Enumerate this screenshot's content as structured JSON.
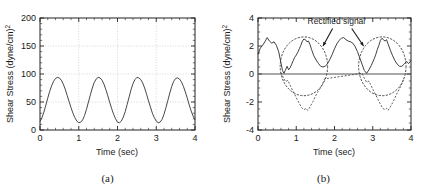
{
  "figure": {
    "panel_a_label": "(a)",
    "panel_b_label": "(b)"
  },
  "panel_a": {
    "xlabel": "Time (sec)",
    "ylabel": "Shear Stress (dyne/cm²)",
    "xticks": [
      "0",
      "1",
      "2",
      "3",
      "4"
    ],
    "yticks": [
      "0",
      "50",
      "100",
      "150",
      "200"
    ]
  },
  "panel_b": {
    "xlabel": "Time (sec)",
    "ylabel": "Shear Stress (dyne/cm²)",
    "xticks": [
      "0",
      "1",
      "2",
      "3",
      "4"
    ],
    "yticks": [
      "-4",
      "-2",
      "0",
      "2",
      "4"
    ],
    "annotation": "Rectified signal"
  },
  "colors": {
    "line": "#333333",
    "grid": "#bbbbbb",
    "axis": "#222222",
    "zero_line": "#555555",
    "dashed": "#444444"
  },
  "chart_data": [
    {
      "type": "line",
      "title": "(a)",
      "xlabel": "Time (sec)",
      "ylabel": "Shear Stress (dyne/cm²)",
      "xlim": [
        0,
        4
      ],
      "ylim": [
        0,
        200
      ],
      "xticks": [
        0,
        1,
        2,
        3,
        4
      ],
      "yticks": [
        0,
        50,
        100,
        150,
        200
      ],
      "grid": true,
      "legend": "none",
      "series": [
        {
          "name": "Pulsatile shear stress",
          "style": "solid",
          "period_sec": 1.0,
          "peak_value": 94,
          "trough_value": 13,
          "x": [
            0.0,
            0.05,
            0.1,
            0.15,
            0.2,
            0.25,
            0.3,
            0.35,
            0.4,
            0.45,
            0.5,
            0.55,
            0.6,
            0.65,
            0.7,
            0.75,
            0.8,
            0.85,
            0.9,
            0.95,
            1.0,
            1.05,
            1.1,
            1.15,
            1.2,
            1.25,
            1.3,
            1.35,
            1.4,
            1.45,
            1.5,
            1.55,
            1.6,
            1.65,
            1.7,
            1.75,
            1.8,
            1.85,
            1.9,
            1.95,
            2.0,
            2.05,
            2.1,
            2.15,
            2.2,
            2.25,
            2.3,
            2.35,
            2.4,
            2.45,
            2.5,
            2.55,
            2.6,
            2.65,
            2.7,
            2.75,
            2.8,
            2.85,
            2.9,
            2.95,
            3.0,
            3.05,
            3.1,
            3.15,
            3.2,
            3.25,
            3.3,
            3.35,
            3.4,
            3.45,
            3.5,
            3.55,
            3.6,
            3.65,
            3.7,
            3.75,
            3.8,
            3.85,
            3.9,
            3.95,
            4.0
          ],
          "y": [
            15,
            22,
            32,
            44,
            57,
            69,
            79,
            87,
            92,
            94,
            93,
            89,
            82,
            73,
            62,
            51,
            40,
            30,
            22,
            16,
            13,
            14,
            18,
            26,
            37,
            50,
            63,
            75,
            85,
            91,
            94,
            93,
            89,
            82,
            72,
            61,
            49,
            38,
            28,
            20,
            14,
            13,
            16,
            23,
            33,
            46,
            59,
            72,
            83,
            90,
            94,
            93,
            90,
            84,
            75,
            64,
            52,
            41,
            30,
            22,
            16,
            13,
            14,
            19,
            28,
            40,
            53,
            66,
            78,
            87,
            92,
            93,
            91,
            86,
            78,
            68,
            57,
            45,
            34,
            25,
            18
          ]
        }
      ]
    },
    {
      "type": "line",
      "title": "(b)",
      "xlabel": "Time (sec)",
      "ylabel": "Shear Stress (dyne/cm²)",
      "xlim": [
        0,
        4
      ],
      "ylim": [
        -4,
        4
      ],
      "xticks": [
        0,
        1,
        2,
        3,
        4
      ],
      "yticks": [
        -4,
        -2,
        0,
        2,
        4
      ],
      "grid": false,
      "zero_line": true,
      "annotations": [
        {
          "text": "Rectified signal",
          "x": 2.05,
          "y": 3.6
        },
        {
          "shape": "ellipse",
          "center_x": 1.2,
          "center_y": 0.55,
          "rx": 0.62,
          "ry": 2.1
        },
        {
          "shape": "ellipse",
          "center_x": 3.25,
          "center_y": 0.55,
          "rx": 0.62,
          "ry": 2.1
        },
        {
          "shape": "arrow",
          "from_x": 1.95,
          "from_y": 3.25,
          "to_x": 1.7,
          "to_y": 2.0
        },
        {
          "shape": "arrow",
          "from_x": 2.45,
          "from_y": 3.25,
          "to_x": 2.76,
          "to_y": 2.0
        }
      ],
      "series": [
        {
          "name": "Rectified signal",
          "style": "solid",
          "x": [
            0.0,
            0.06,
            0.12,
            0.18,
            0.24,
            0.3,
            0.36,
            0.42,
            0.48,
            0.54,
            0.6,
            0.64,
            0.68,
            0.72,
            0.76,
            0.8,
            0.84,
            0.88,
            0.92,
            0.96,
            1.0,
            1.04,
            1.08,
            1.12,
            1.16,
            1.2,
            1.24,
            1.28,
            1.32,
            1.36,
            1.4,
            1.46,
            1.52,
            1.58,
            1.64,
            1.7,
            1.76,
            1.82,
            1.88,
            1.94,
            2.0,
            2.06,
            2.12,
            2.18,
            2.24,
            2.3,
            2.36,
            2.42,
            2.48,
            2.54,
            2.6,
            2.66,
            2.72,
            2.78,
            2.84,
            2.9,
            2.96,
            3.0,
            3.04,
            3.08,
            3.12,
            3.16,
            3.2,
            3.24,
            3.28,
            3.32,
            3.36,
            3.4,
            3.46,
            3.52,
            3.58,
            3.64,
            3.7,
            3.76,
            3.82,
            3.88,
            3.94,
            4.0
          ],
          "y": [
            1.4,
            1.85,
            2.05,
            2.3,
            2.6,
            2.35,
            2.2,
            2.3,
            2.05,
            1.6,
            0.8,
            0.25,
            0.05,
            0.3,
            0.55,
            0.3,
            0.45,
            0.7,
            0.95,
            1.2,
            1.35,
            1.55,
            1.8,
            2.05,
            2.35,
            2.5,
            2.45,
            2.3,
            2.35,
            2.1,
            1.75,
            1.3,
            1.0,
            0.75,
            0.55,
            0.5,
            0.55,
            0.75,
            1.05,
            1.4,
            1.8,
            2.15,
            2.4,
            2.55,
            2.6,
            2.45,
            2.35,
            2.3,
            2.2,
            1.95,
            1.6,
            1.15,
            0.7,
            0.25,
            0.05,
            0.3,
            0.6,
            0.85,
            1.1,
            1.4,
            1.75,
            2.05,
            2.4,
            2.55,
            2.45,
            2.35,
            2.45,
            2.15,
            1.7,
            1.3,
            0.95,
            0.7,
            0.55,
            0.55,
            0.7,
            0.9,
            0.75,
            0.95
          ]
        },
        {
          "name": "Original signal (negative half)",
          "style": "dashed",
          "x": [
            0.6,
            0.66,
            0.72,
            0.78,
            0.84,
            0.9,
            0.96,
            1.02,
            1.08,
            1.14,
            1.2,
            1.26,
            1.3,
            1.34,
            1.38,
            1.44,
            1.5,
            1.56,
            1.62,
            1.68,
            1.74,
            2.72,
            2.78,
            2.84,
            2.9,
            2.96,
            3.02,
            3.08,
            3.14,
            3.2,
            3.26,
            3.32,
            3.36,
            3.4,
            3.46,
            3.52,
            3.58,
            3.64,
            3.7,
            3.76,
            3.82
          ],
          "y": [
            0.1,
            -0.25,
            -0.55,
            -0.45,
            -0.8,
            -1.15,
            -1.45,
            -1.8,
            -2.1,
            -2.4,
            -2.55,
            -2.45,
            -2.6,
            -2.45,
            -2.25,
            -1.95,
            -1.6,
            -1.3,
            -1.05,
            -0.75,
            -0.35,
            0.05,
            -0.3,
            -0.6,
            -0.5,
            -0.85,
            -1.2,
            -1.5,
            -1.85,
            -2.15,
            -2.45,
            -2.55,
            -2.45,
            -2.6,
            -2.35,
            -2.05,
            -1.7,
            -1.35,
            -1.05,
            -0.7,
            -0.3
          ]
        }
      ]
    }
  ]
}
